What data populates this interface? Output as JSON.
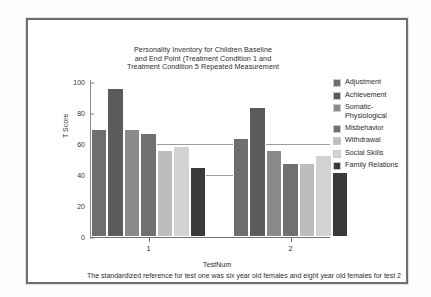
{
  "chart_data": {
    "type": "bar",
    "title": "Personality Inventory for Children Baseline and End Point  (Treatment Condition 1 and Treatment Condition 5 Repeated Measurement",
    "title_lines": [
      "Personality Inventory for Children Baseline",
      "and End Point  (Treatment Condition 1 and",
      "Treatment Condition 5 Repeated Measurement"
    ],
    "xlabel": "TestNum",
    "ylabel": "T Score",
    "categories": [
      "1",
      "2"
    ],
    "ylim": [
      0,
      100
    ],
    "yticks": [
      0,
      20,
      40,
      60,
      80,
      100
    ],
    "gridlines": [
      40,
      60
    ],
    "grid": true,
    "legend_position": "right",
    "caption": "The standardized reference for test one was six year old females and eight year old females for test 2",
    "caption_lines": [
      "The standardized reference for test one was six year old females and eight year old females for",
      "test 2"
    ],
    "series": [
      {
        "name": "Adjustment",
        "label_lines": "Adjustment",
        "color": "#6e6e6e",
        "values": [
          70,
          64
        ]
      },
      {
        "name": "Achievement",
        "label_lines": "Achievement",
        "color": "#5b5b5b",
        "values": [
          96,
          84
        ]
      },
      {
        "name": "Somatic-Physiological",
        "label_lines": "Somatic-\nPhysiological",
        "color": "#8a8a8a",
        "values": [
          70,
          56
        ]
      },
      {
        "name": "Misbehavior",
        "label_lines": "Misbehavior",
        "color": "#707070",
        "values": [
          67,
          48
        ]
      },
      {
        "name": "Withdrawal",
        "label_lines": "Withdrawal",
        "color": "#bdbdbd",
        "values": [
          56,
          48
        ]
      },
      {
        "name": "Social Skills",
        "label_lines": "Social Skills",
        "color": "#d2d2d2",
        "values": [
          59,
          53
        ]
      },
      {
        "name": "Family Relations",
        "label_lines": "Family Relations",
        "color": "#3a3a3a",
        "values": [
          45,
          42
        ]
      }
    ]
  }
}
